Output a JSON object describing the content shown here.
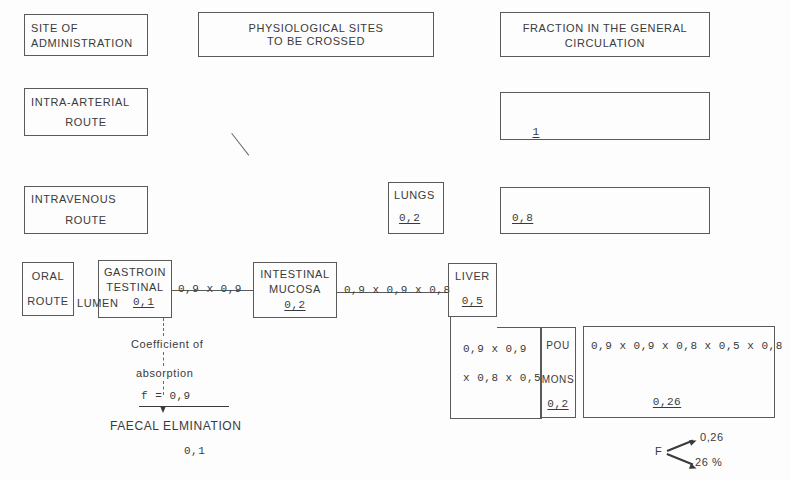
{
  "diagram": {
    "headers": {
      "col1_line1": "SITE OF",
      "col1_line2": "ADMINISTRATION",
      "col2_line1": "PHYSIOLOGICAL SITES",
      "col2_line2": "TO BE CROSSED",
      "col3_line1": "FRACTION IN THE GENERAL",
      "col3_line2": "CIRCULATION"
    },
    "routes": {
      "intra_arterial_line1": "INTRA-ARTERIAL",
      "intra_arterial_line2": "ROUTE",
      "intra_arterial_fraction": "1",
      "intravenous_line1": "INTRAVENOUS",
      "intravenous_line2": "ROUTE",
      "intravenous_fraction": "0,8",
      "oral_line1": "ORAL",
      "oral_line2": "ROUTE"
    },
    "sites": {
      "lungs_label": "LUNGS",
      "lungs_value": "0,2",
      "gi_line1": "GASTROIN",
      "gi_line2": "TESTINAL",
      "gi_line3": "LUMEN",
      "gi_value": "0,1",
      "mucosa_line1": "INTESTINAL",
      "mucosa_line2": "MUCOSA",
      "mucosa_value": "0,2",
      "liver_label": "LIVER",
      "liver_value": "0,5",
      "poumons_line1": "POU",
      "poumons_line2": "MONS",
      "poumons_value": "0,2"
    },
    "connectors": {
      "gi_to_mucosa": "0,9 x 0,9",
      "mucosa_to_liver": "0,9 x 0,9 x 0,8"
    },
    "computations": {
      "liver_out_line1": "0,9 x 0,9",
      "liver_out_line2": "x 0,8 x 0,5",
      "final_expression": "0,9 x 0,9 x 0,8 x 0,5 x 0,8",
      "final_value": "0,26"
    },
    "absorption": {
      "coefficient_line1": "Coefficient of",
      "coefficient_line2": "absorption",
      "coefficient_value": "f = 0,9",
      "faecal_label": "FAECAL ELMINATION",
      "faecal_value": "0,1"
    },
    "bioavailability": {
      "symbol": "F",
      "value_fraction": "0,26",
      "value_percent": "26 %"
    },
    "colors": {
      "stroke": "#5a5a5a",
      "text": "#3a3a3a",
      "background": "#fdfdfd"
    }
  }
}
